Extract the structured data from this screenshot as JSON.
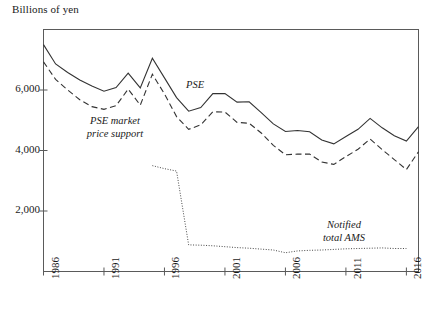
{
  "chart_data": {
    "type": "line",
    "title": "",
    "ylabel": "Billions of yen",
    "xlabel": "",
    "ylim": [
      0,
      8000
    ],
    "xlim": [
      1986,
      2017
    ],
    "grid": false,
    "legend_position": "inline-annotations",
    "yticks": [
      2000,
      4000,
      6000
    ],
    "ytick_labels": [
      "2,000",
      "4,000",
      "6,000"
    ],
    "xticks": [
      1986,
      1991,
      1996,
      2001,
      2006,
      2011,
      2016
    ],
    "xtick_labels": [
      "1986",
      "1991",
      "1996",
      "2001",
      "2006",
      "2011",
      "2016"
    ],
    "series": [
      {
        "name": "PSE",
        "style": "solid",
        "label": "PSE",
        "x": [
          1986,
          1987,
          1988,
          1989,
          1990,
          1991,
          1992,
          1993,
          1994,
          1995,
          1996,
          1997,
          1998,
          1999,
          2000,
          2001,
          2002,
          2003,
          2004,
          2005,
          2006,
          2007,
          2008,
          2009,
          2010,
          2011,
          2012,
          2013,
          2014,
          2015,
          2016,
          2017
        ],
        "values": [
          7500,
          6860,
          6580,
          6330,
          6130,
          5960,
          6080,
          6560,
          6070,
          7050,
          6400,
          5750,
          5300,
          5420,
          5880,
          5880,
          5600,
          5610,
          5250,
          4880,
          4630,
          4660,
          4620,
          4350,
          4220,
          4460,
          4700,
          5060,
          4750,
          4490,
          4310,
          4790
        ]
      },
      {
        "name": "PSE market price support",
        "style": "dashed",
        "label": "PSE market\nprice support",
        "x": [
          1986,
          1987,
          1988,
          1989,
          1990,
          1991,
          1992,
          1993,
          1994,
          1995,
          1996,
          1997,
          1998,
          1999,
          2000,
          2001,
          2002,
          2003,
          2004,
          2005,
          2006,
          2007,
          2008,
          2009,
          2010,
          2011,
          2012,
          2013,
          2014,
          2015,
          2016,
          2017
        ],
        "values": [
          6930,
          6350,
          6000,
          5680,
          5450,
          5360,
          5480,
          6030,
          5500,
          6520,
          5870,
          5120,
          4700,
          4850,
          5280,
          5270,
          4930,
          4900,
          4580,
          4170,
          3860,
          3880,
          3880,
          3620,
          3540,
          3800,
          4040,
          4380,
          4030,
          3700,
          3370,
          3960
        ]
      },
      {
        "name": "Notified total AMS",
        "style": "dotted",
        "label": "Notified\ntotal AMS",
        "x": [
          1995,
          1996,
          1997,
          1998,
          1999,
          2000,
          2001,
          2002,
          2003,
          2004,
          2005,
          2006,
          2007,
          2008,
          2009,
          2010,
          2011,
          2012,
          2013,
          2014,
          2015,
          2016
        ],
        "values": [
          3500,
          3400,
          3320,
          880,
          870,
          850,
          820,
          790,
          770,
          740,
          710,
          620,
          680,
          700,
          710,
          730,
          750,
          760,
          770,
          780,
          760,
          760
        ]
      }
    ],
    "annotations": [
      {
        "text": "PSE",
        "x": 2000,
        "y": 6200
      },
      {
        "text": "PSE market price support",
        "x": 1992,
        "y": 4700
      },
      {
        "text": "Notified total AMS",
        "x": 2009,
        "y": 1700
      }
    ]
  },
  "labels": {
    "axis_title": "Billions of yen",
    "pse": "PSE",
    "pse_mps_line1": "PSE market",
    "pse_mps_line2": "price support",
    "ams_line1": "Notified",
    "ams_line2": "total AMS"
  }
}
